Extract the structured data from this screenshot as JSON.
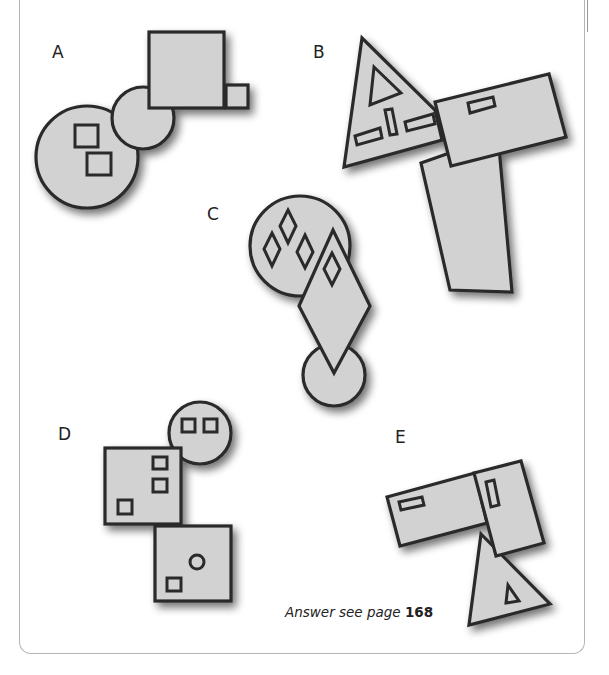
{
  "puzzle": {
    "figures": [
      {
        "label": "A",
        "description": "Large circle with two small squares, small circle, large square with small square"
      },
      {
        "label": "B",
        "description": "Triangle with inner triangle and three small rectangles, tilted rectangle with small rectangle, tilted tall rectangle"
      },
      {
        "label": "C",
        "description": "Circle with three small diamonds, large diamond with one small diamond, small circle"
      },
      {
        "label": "D",
        "description": "Small circle with two squares, square with three small squares, square with small circle and small square"
      },
      {
        "label": "E",
        "description": "Tilted rectangle with small rectangle, tilted rectangle with vertical small rectangle, triangle with small triangle"
      }
    ],
    "caption": {
      "prefix": "Answer see page ",
      "page": "168"
    }
  },
  "colors": {
    "shape_fill": "#d2d2d2",
    "outline": "#2a2a2a",
    "panel_border": "#b5b5b5"
  }
}
